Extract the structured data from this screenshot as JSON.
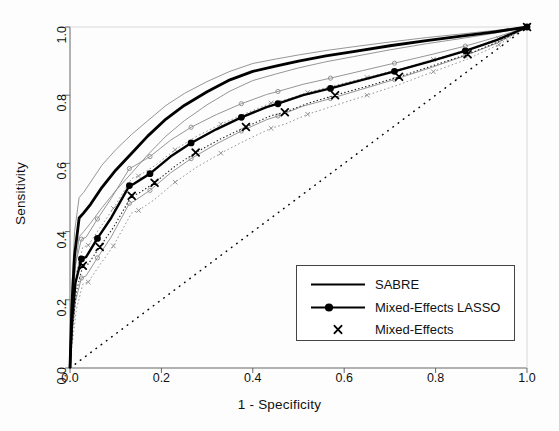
{
  "chart_data": {
    "type": "line",
    "title": "",
    "xlabel": "1 - Specificity",
    "ylabel": "Sensitivity",
    "xlim": [
      0.0,
      1.0
    ],
    "ylim": [
      0.0,
      1.0
    ],
    "grid": false,
    "xticks": [
      "0.0",
      "0.2",
      "0.4",
      "0.6",
      "0.8",
      "1.0"
    ],
    "xtick_values": [
      0.0,
      0.2,
      0.4,
      0.6,
      0.8,
      1.0
    ],
    "yticks": [
      "0.0",
      "0.2",
      "0.4",
      "0.6",
      "0.8",
      "1.0"
    ],
    "ytick_values": [
      0.0,
      0.2,
      0.4,
      0.6,
      0.8,
      1.0
    ],
    "legend_position": "bottom-right",
    "legend_entries": [
      {
        "label": "SABRE",
        "key": "solid-line"
      },
      {
        "label": "Mixed-Effects LASSO",
        "key": "line-with-circle-marker"
      },
      {
        "label": "Mixed-Effects",
        "key": "x-marker"
      }
    ],
    "series": [
      {
        "name": "SABRE",
        "style": "thick-solid",
        "x": [
          0.0,
          0.004,
          0.01,
          0.02,
          0.03,
          0.045,
          0.07,
          0.1,
          0.135,
          0.17,
          0.21,
          0.25,
          0.3,
          0.35,
          0.4,
          0.45,
          0.5,
          0.56,
          0.62,
          0.7,
          0.78,
          0.86,
          0.93,
          1.0
        ],
        "y": [
          0.0,
          0.18,
          0.33,
          0.44,
          0.455,
          0.48,
          0.53,
          0.58,
          0.63,
          0.68,
          0.73,
          0.77,
          0.81,
          0.845,
          0.87,
          0.885,
          0.9,
          0.915,
          0.928,
          0.945,
          0.96,
          0.974,
          0.986,
          1.0
        ]
      },
      {
        "name": "SABRE upper band",
        "style": "thin-solid",
        "x": [
          0.0,
          0.004,
          0.01,
          0.02,
          0.03,
          0.045,
          0.07,
          0.1,
          0.135,
          0.17,
          0.21,
          0.25,
          0.3,
          0.35,
          0.4,
          0.45,
          0.5,
          0.56,
          0.62,
          0.7,
          0.78,
          0.86,
          0.93,
          1.0
        ],
        "y": [
          0.0,
          0.23,
          0.4,
          0.5,
          0.515,
          0.545,
          0.595,
          0.64,
          0.685,
          0.725,
          0.77,
          0.805,
          0.84,
          0.87,
          0.893,
          0.906,
          0.918,
          0.931,
          0.942,
          0.956,
          0.969,
          0.98,
          0.99,
          1.0
        ]
      },
      {
        "name": "SABRE lower band",
        "style": "thin-solid",
        "x": [
          0.0,
          0.004,
          0.01,
          0.02,
          0.03,
          0.045,
          0.07,
          0.1,
          0.135,
          0.17,
          0.21,
          0.25,
          0.3,
          0.35,
          0.4,
          0.45,
          0.5,
          0.56,
          0.62,
          0.7,
          0.78,
          0.86,
          0.93,
          1.0
        ],
        "y": [
          0.0,
          0.14,
          0.275,
          0.385,
          0.4,
          0.425,
          0.47,
          0.52,
          0.572,
          0.625,
          0.68,
          0.725,
          0.772,
          0.812,
          0.843,
          0.862,
          0.88,
          0.898,
          0.913,
          0.933,
          0.951,
          0.967,
          0.982,
          1.0
        ]
      },
      {
        "name": "Mixed-Effects LASSO",
        "style": "thick-solid-circle-markers",
        "x": [
          0.0,
          0.004,
          0.012,
          0.025,
          0.035,
          0.06,
          0.09,
          0.13,
          0.14,
          0.175,
          0.22,
          0.265,
          0.32,
          0.375,
          0.43,
          0.455,
          0.51,
          0.57,
          0.64,
          0.71,
          0.79,
          0.865,
          0.935,
          1.0
        ],
        "y": [
          0.0,
          0.13,
          0.25,
          0.32,
          0.325,
          0.38,
          0.44,
          0.535,
          0.54,
          0.57,
          0.62,
          0.66,
          0.7,
          0.735,
          0.765,
          0.775,
          0.8,
          0.82,
          0.845,
          0.87,
          0.9,
          0.93,
          0.962,
          1.0
        ]
      },
      {
        "name": "Mixed-Effects LASSO upper band",
        "style": "thin-solid-small-markers",
        "x": [
          0.0,
          0.004,
          0.012,
          0.025,
          0.035,
          0.06,
          0.09,
          0.13,
          0.14,
          0.175,
          0.22,
          0.265,
          0.32,
          0.375,
          0.43,
          0.455,
          0.51,
          0.57,
          0.64,
          0.71,
          0.79,
          0.865,
          0.935,
          1.0
        ],
        "y": [
          0.0,
          0.175,
          0.305,
          0.378,
          0.383,
          0.437,
          0.497,
          0.585,
          0.592,
          0.62,
          0.668,
          0.706,
          0.743,
          0.775,
          0.802,
          0.811,
          0.832,
          0.85,
          0.872,
          0.894,
          0.919,
          0.944,
          0.971,
          1.0
        ]
      },
      {
        "name": "Mixed-Effects LASSO lower band",
        "style": "thin-solid-small-markers",
        "x": [
          0.0,
          0.004,
          0.012,
          0.025,
          0.035,
          0.06,
          0.09,
          0.13,
          0.14,
          0.175,
          0.22,
          0.265,
          0.32,
          0.375,
          0.43,
          0.455,
          0.51,
          0.57,
          0.64,
          0.71,
          0.79,
          0.865,
          0.935,
          1.0
        ],
        "y": [
          0.0,
          0.09,
          0.196,
          0.264,
          0.27,
          0.323,
          0.384,
          0.483,
          0.489,
          0.521,
          0.572,
          0.614,
          0.657,
          0.695,
          0.728,
          0.739,
          0.768,
          0.79,
          0.818,
          0.846,
          0.881,
          0.916,
          0.953,
          1.0
        ]
      },
      {
        "name": "Mixed-Effects",
        "style": "dotted-x-markers",
        "x": [
          0.0,
          0.005,
          0.014,
          0.028,
          0.04,
          0.065,
          0.095,
          0.135,
          0.15,
          0.185,
          0.23,
          0.275,
          0.33,
          0.385,
          0.44,
          0.47,
          0.52,
          0.58,
          0.65,
          0.72,
          0.795,
          0.87,
          0.938,
          1.0
        ],
        "y": [
          0.0,
          0.11,
          0.225,
          0.3,
          0.305,
          0.355,
          0.412,
          0.505,
          0.512,
          0.543,
          0.592,
          0.632,
          0.672,
          0.707,
          0.74,
          0.75,
          0.776,
          0.8,
          0.826,
          0.854,
          0.887,
          0.92,
          0.957,
          1.0
        ]
      },
      {
        "name": "Mixed-Effects upper band",
        "style": "dotted-thin",
        "x": [
          0.0,
          0.005,
          0.014,
          0.028,
          0.04,
          0.065,
          0.095,
          0.135,
          0.15,
          0.185,
          0.23,
          0.275,
          0.33,
          0.385,
          0.44,
          0.47,
          0.52,
          0.58,
          0.65,
          0.72,
          0.795,
          0.87,
          0.938,
          1.0
        ],
        "y": [
          0.0,
          0.155,
          0.28,
          0.355,
          0.36,
          0.41,
          0.468,
          0.556,
          0.563,
          0.593,
          0.64,
          0.678,
          0.715,
          0.747,
          0.777,
          0.786,
          0.808,
          0.829,
          0.852,
          0.876,
          0.905,
          0.934,
          0.966,
          1.0
        ]
      },
      {
        "name": "Mixed-Effects lower band",
        "style": "dotted-thin",
        "x": [
          0.0,
          0.005,
          0.014,
          0.028,
          0.04,
          0.065,
          0.095,
          0.135,
          0.15,
          0.185,
          0.23,
          0.275,
          0.33,
          0.385,
          0.44,
          0.47,
          0.52,
          0.58,
          0.65,
          0.72,
          0.795,
          0.87,
          0.938,
          1.0
        ],
        "y": [
          0.0,
          0.072,
          0.172,
          0.246,
          0.252,
          0.302,
          0.358,
          0.455,
          0.462,
          0.494,
          0.545,
          0.587,
          0.63,
          0.668,
          0.703,
          0.715,
          0.744,
          0.77,
          0.8,
          0.831,
          0.869,
          0.906,
          0.948,
          1.0
        ]
      },
      {
        "name": "Reference diagonal",
        "style": "dotted",
        "x": [
          0.0,
          1.0
        ],
        "y": [
          0.0,
          1.0
        ]
      }
    ]
  },
  "colors": {
    "line": "#000000",
    "band": "#777777",
    "axis": "#666666",
    "text": "#111111",
    "background": "#fdfdfd"
  }
}
